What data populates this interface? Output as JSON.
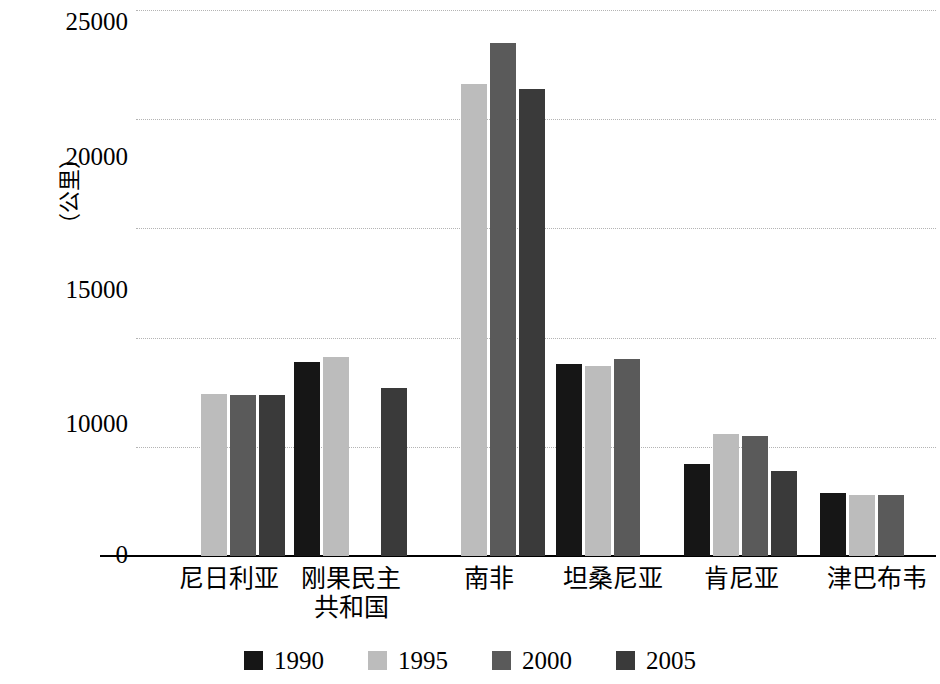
{
  "chart_data": {
    "type": "bar",
    "title": "",
    "subtitle": "",
    "xlabel": "",
    "ylabel": "（公里）",
    "ylim": [
      0,
      25000
    ],
    "ytick_labels": [
      "25000",
      "20000",
      "15000",
      "10000",
      "0"
    ],
    "ytick_values": [
      25000,
      20000,
      15000,
      10000,
      0
    ],
    "gridline_values": [
      25000,
      20000,
      15000,
      10000,
      5000
    ],
    "grid": true,
    "legend_position": "bottom",
    "categories": [
      "尼日利亚",
      "刚果民主\n共和国",
      "南非",
      "坦桑尼亚",
      "肯尼亚",
      "津巴布韦"
    ],
    "series": [
      {
        "name": "1990",
        "color": "#161616",
        "values": [
          null,
          8900,
          null,
          8800,
          4200,
          2900
        ]
      },
      {
        "name": "1995",
        "color": "#bcbcbc",
        "values": [
          7400,
          9100,
          21600,
          8700,
          5600,
          2800
        ]
      },
      {
        "name": "2000",
        "color": "#5a5a5a",
        "values": [
          7350,
          null,
          23500,
          9000,
          5500,
          2800
        ]
      },
      {
        "name": "2005",
        "color": "#3a3a3a",
        "values": [
          7350,
          7700,
          21400,
          null,
          3900,
          null
        ]
      }
    ]
  },
  "legend": {
    "items": [
      {
        "label": "1990",
        "color": "#161616"
      },
      {
        "label": "1995",
        "color": "#bcbcbc"
      },
      {
        "label": "2000",
        "color": "#5a5a5a"
      },
      {
        "label": "2005",
        "color": "#3a3a3a"
      }
    ]
  },
  "axis": {
    "y_title": "（公里）",
    "y_ticks": [
      {
        "label": "25000",
        "value": 25000
      },
      {
        "label": "20000",
        "value": 20000
      },
      {
        "label": "15000",
        "value": 15000
      },
      {
        "label": "10000",
        "value": 10000
      },
      {
        "label": "0",
        "value": 0
      }
    ]
  },
  "x_categories": [
    {
      "label": "尼日利亚"
    },
    {
      "label": "刚果民主\n共和国"
    },
    {
      "label": "南非"
    },
    {
      "label": "坦桑尼亚"
    },
    {
      "label": "肯尼亚"
    },
    {
      "label": "津巴布韦"
    }
  ]
}
